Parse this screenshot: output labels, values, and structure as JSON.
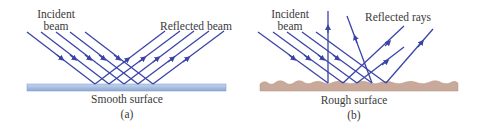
{
  "panel_a": {
    "incident_label_line1": "Incident",
    "incident_label_line2": "beam",
    "reflected_label": "Reflected beam",
    "surface_label": "Smooth surface",
    "caption": "(a)",
    "ray_count": 5
  },
  "panel_b": {
    "incident_label_line1": "Incident",
    "incident_label_line2": "beam",
    "reflected_label": "Reflected rays",
    "surface_label": "Rough surface",
    "caption": "(b)",
    "ray_count": 5
  },
  "colors": {
    "ray": "#3a44a8",
    "smooth_surface": "#a9bfe0",
    "rough_surface": "#c9a99a",
    "text": "#3a3a3a"
  }
}
